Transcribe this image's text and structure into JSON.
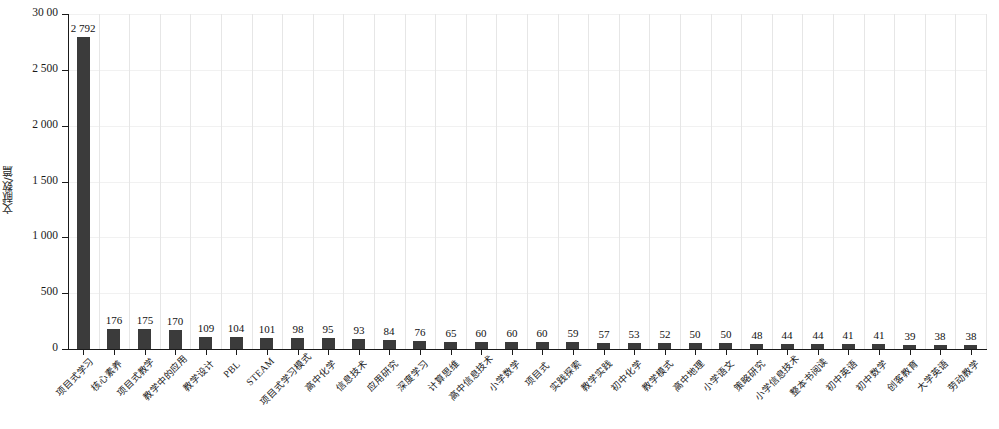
{
  "chart_data": {
    "type": "bar",
    "title": "",
    "xlabel": "",
    "ylabel": "文献数/篇",
    "ylim": [
      0,
      3000
    ],
    "ytick_labels": [
      "30 00",
      "2 500",
      "2 000",
      "1 500",
      "1 000",
      "500",
      "0"
    ],
    "ytick_values": [
      3000,
      2500,
      2000,
      1500,
      1000,
      500,
      0
    ],
    "grid": true,
    "legend": null,
    "categories": [
      "项目式学习",
      "核心素养",
      "项目式教学",
      "教学中的应用",
      "教学设计",
      "PBL",
      "STEAM",
      "项目式学习模式",
      "高中化学",
      "信息技术",
      "应用研究",
      "深度学习",
      "计算思维",
      "高中信息技术",
      "小学数学",
      "项目式",
      "实践探索",
      "教学实践",
      "初中化学",
      "教学模式",
      "高中地理",
      "小学语文",
      "策略研究",
      "小学信息技术",
      "整本书阅读",
      "初中英语",
      "初中数学",
      "创客教育",
      "大学英语",
      "劳动教学"
    ],
    "values": [
      2792,
      176,
      175,
      170,
      109,
      104,
      101,
      98,
      95,
      93,
      84,
      76,
      65,
      60,
      60,
      60,
      59,
      57,
      53,
      52,
      50,
      50,
      48,
      44,
      44,
      41,
      41,
      39,
      38,
      38
    ],
    "value_labels": [
      "2 792",
      "176",
      "175",
      "170",
      "109",
      "104",
      "101",
      "98",
      "95",
      "93",
      "84",
      "76",
      "65",
      "60",
      "60",
      "60",
      "59",
      "57",
      "53",
      "52",
      "50",
      "50",
      "48",
      "44",
      "44",
      "41",
      "41",
      "39",
      "38",
      "38"
    ],
    "bar_color": "#3b3b3b"
  }
}
